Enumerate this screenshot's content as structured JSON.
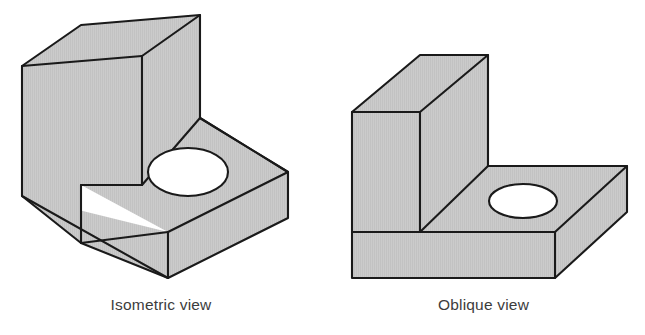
{
  "figure": {
    "background_color": "#ffffff",
    "line_color": "#1a1a1a",
    "face_fill_color": "#c9c9c9",
    "hole_fill_color": "#ffffff",
    "caption_color": "#3c3c3c",
    "panels": [
      {
        "id": "isometric",
        "caption": "Isometric view",
        "object_description": "L-shaped block with vertical back wall, horizontal base and a round through-hole in the base",
        "projection": "isometric",
        "hole": {
          "cx": 188,
          "cy": 172,
          "rx": 40,
          "ry": 24
        },
        "faces": [
          {
            "name": "wall-top-face",
            "points": "22,66 81,25 200,15 142,56"
          },
          {
            "name": "wall-front-right-face",
            "points": "142,56 200,15 200,118 142,185"
          },
          {
            "name": "wall-left-face",
            "points": "22,66 142,56 142,185 81,185 81,243 22,196"
          },
          {
            "name": "base-top-face",
            "points": "81,185 142,185 200,118 288,172 168,232"
          },
          {
            "name": "base-front-left-face",
            "points": "22,196 81,243 168,232 168,278"
          },
          {
            "name": "base-front-right-face",
            "points": "168,232 288,172 288,218 168,278"
          }
        ],
        "outline": "22,66 81,25 200,15 200,118 288,172 288,218 168,278 22,196",
        "edges": [
          "22,66 142,56",
          "142,56 200,15",
          "142,56 142,185",
          "142,185 81,185",
          "81,185 81,243",
          "81,243 22,196",
          "81,243 168,278",
          "142,185 200,118",
          "200,118 168,232",
          "168,232 288,172",
          "168,232 168,278"
        ]
      },
      {
        "id": "oblique",
        "caption": "Oblique view",
        "object_description": "L-shaped block with vertical back wall, horizontal base and a round through-hole in the base",
        "projection": "oblique",
        "hole": {
          "cx": 523,
          "cy": 201,
          "rx": 34,
          "ry": 17
        },
        "faces": [
          {
            "name": "wall-top-face",
            "points": "352,112 420,55 488,55 420,112"
          },
          {
            "name": "wall-right-face",
            "points": "420,112 488,55 488,166 420,232"
          },
          {
            "name": "wall-front-face",
            "points": "352,112 420,112 420,232 352,232"
          },
          {
            "name": "base-front-face",
            "points": "352,232 420,232 555,232 555,278 352,278"
          },
          {
            "name": "base-top-face",
            "points": "420,232 488,166 627,166 555,232"
          },
          {
            "name": "base-right-face",
            "points": "555,232 627,166 627,212 555,278"
          }
        ],
        "outline": "352,112 420,55 488,55 488,166 627,166 627,212 555,278 352,278",
        "edges": [
          "352,112 420,112",
          "420,112 488,55",
          "420,112 420,232",
          "420,232 488,166",
          "420,232 555,232",
          "555,232 627,166",
          "555,232 555,278",
          "352,232 420,232"
        ]
      }
    ]
  }
}
